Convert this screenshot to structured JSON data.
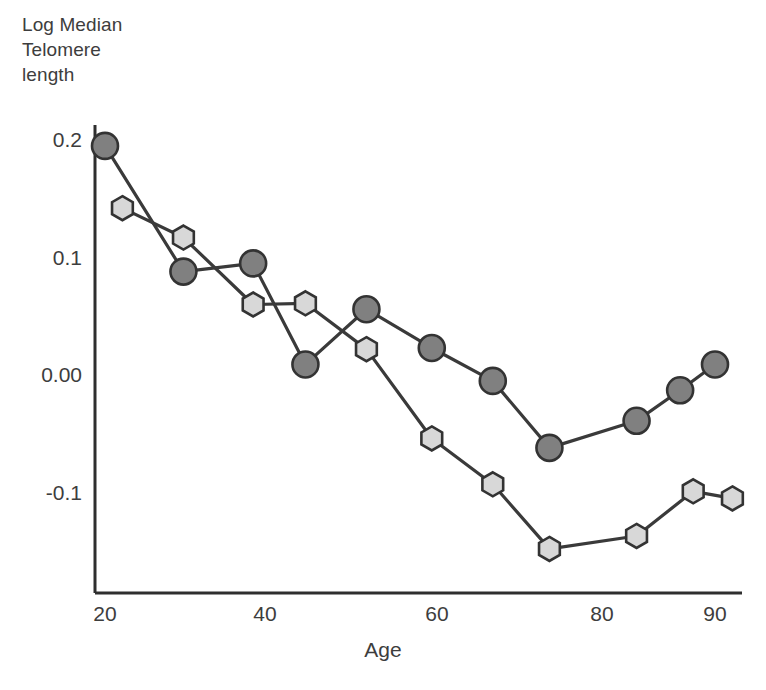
{
  "figure": {
    "y_axis_title": "Log Median\nTelomere\nlength",
    "x_axis_title": "Age",
    "ytick_labels": [
      "0.2",
      "0.1",
      "0.00",
      "-0.1"
    ],
    "xtick_labels": [
      "20",
      "40",
      "60",
      "80",
      "90"
    ],
    "colors": {
      "series_dark_fill": "#808080",
      "series_light_fill": "#d8d8d8",
      "marker_stroke": "#333333",
      "line": "#3a3a3a",
      "axis": "#2e2e2e",
      "text": "#3d3d3d"
    }
  },
  "chart_data": {
    "type": "line",
    "title": "",
    "xlabel": "Age",
    "ylabel": "Log Median Telomere length",
    "xlim": [
      20,
      93
    ],
    "ylim": [
      -0.175,
      0.215
    ],
    "xticks": [
      20,
      40,
      60,
      80,
      90
    ],
    "yticks": [
      0.2,
      0.1,
      0.0,
      -0.1
    ],
    "ytick_labels": [
      "0.2",
      "0.1",
      "0.00",
      "-0.1"
    ],
    "grid": false,
    "legend": "none",
    "series": [
      {
        "name": "dark-circles",
        "marker": "circle",
        "fill": "#808080",
        "x": [
          20,
          29,
          37,
          43,
          50,
          57.5,
          64.5,
          71,
          81,
          86,
          90
        ],
        "values": [
          0.195,
          0.088,
          0.095,
          0.009,
          0.056,
          0.023,
          -0.005,
          -0.062,
          -0.039,
          -0.013,
          0.009
        ]
      },
      {
        "name": "light-hexagons",
        "marker": "hexagon",
        "fill": "#d8d8d8",
        "x": [
          22,
          29,
          37,
          43,
          50,
          57.5,
          64.5,
          71,
          81,
          87.5,
          92
        ],
        "values": [
          0.142,
          0.117,
          0.06,
          0.061,
          0.022,
          -0.054,
          -0.093,
          -0.148,
          -0.137,
          -0.099,
          -0.105
        ]
      }
    ]
  }
}
